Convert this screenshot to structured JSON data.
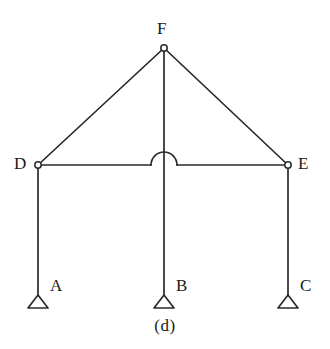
{
  "figure": {
    "caption": "(d)",
    "type": "structural-frame-diagram",
    "background_color": "#ffffff",
    "line_color": "#2a2a2a",
    "label_color": "#1a1a1a"
  },
  "nodes": [
    {
      "id": "F",
      "label": "F",
      "x": 164,
      "y": 48,
      "kind": "hinge-joint",
      "label_x": 157,
      "label_y": 20
    },
    {
      "id": "D",
      "label": "D",
      "x": 38,
      "y": 165,
      "kind": "hinge-joint",
      "label_x": 14,
      "label_y": 155
    },
    {
      "id": "E",
      "label": "E",
      "x": 288,
      "y": 165,
      "kind": "hinge-joint",
      "label_x": 298,
      "label_y": 155
    },
    {
      "id": "A",
      "label": "A",
      "x": 38,
      "y": 295,
      "kind": "pin-support",
      "label_x": 50,
      "label_y": 277
    },
    {
      "id": "B",
      "label": "B",
      "x": 164,
      "y": 295,
      "kind": "pin-support",
      "label_x": 176,
      "label_y": 277
    },
    {
      "id": "C",
      "label": "C",
      "x": 288,
      "y": 295,
      "kind": "pin-support",
      "label_x": 300,
      "label_y": 277
    }
  ],
  "members": [
    {
      "id": "AD",
      "from": "A",
      "to": "D",
      "kind": "column"
    },
    {
      "id": "BF",
      "from": "B",
      "to": "F",
      "kind": "column"
    },
    {
      "id": "CE",
      "from": "C",
      "to": "E",
      "kind": "column"
    },
    {
      "id": "DE",
      "from": "D",
      "to": "E",
      "kind": "beam",
      "crossing": "hop-over-BF"
    },
    {
      "id": "DF",
      "from": "D",
      "to": "F",
      "kind": "rafter"
    },
    {
      "id": "EF",
      "from": "E",
      "to": "F",
      "kind": "rafter"
    }
  ],
  "details": {
    "hop_arc": {
      "center_x": 164,
      "center_y": 165,
      "radius": 13
    },
    "joint_circle_radius": 3.2,
    "support_triangle": {
      "half_width": 10,
      "height": 13
    },
    "stroke_width": 1.7
  }
}
